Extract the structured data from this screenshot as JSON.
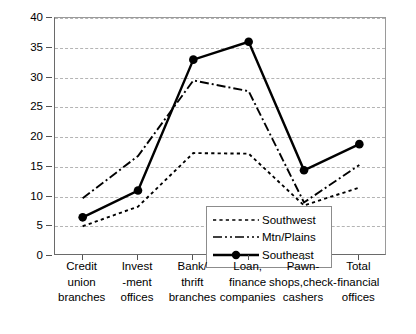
{
  "chart_data": {
    "type": "line",
    "title": "",
    "subtitle": "",
    "xlabel": "",
    "ylabel": "",
    "ylim": [
      0,
      40
    ],
    "yticks": [
      0,
      5,
      10,
      15,
      20,
      25,
      30,
      35,
      40
    ],
    "ytick_labels": [
      "0",
      "5",
      "10",
      "15",
      "20",
      "25",
      "30",
      "35",
      "40"
    ],
    "grid": true,
    "grid_axis": "y",
    "grid_style": "dashed",
    "legend_position": "center-lower-inside",
    "categories": [
      "Credit union branches",
      "Invest-ment offices",
      "Bank/ thrift branches",
      "Loan, finance companies",
      "Pawn-shops,check-cashers",
      "Total financial offices"
    ],
    "category_lines": [
      [
        "Credit",
        "union",
        "branches"
      ],
      [
        "Invest",
        "-ment",
        "offices"
      ],
      [
        "Bank/",
        "thrift",
        "branches"
      ],
      [
        "Loan,",
        "finance",
        "companies"
      ],
      [
        "Pawn-",
        "shops,check-",
        "cashers"
      ],
      [
        "Total",
        "financial",
        "offices"
      ]
    ],
    "series": [
      {
        "name": "Southwest",
        "style": "dotted",
        "marker": "none",
        "color": "#000000",
        "values": [
          5.0,
          8.3,
          17.3,
          17.2,
          8.5,
          11.5
        ]
      },
      {
        "name": "Mtn/Plains",
        "style": "dash-dot",
        "marker": "none",
        "color": "#000000",
        "values": [
          9.7,
          16.8,
          29.5,
          27.7,
          9.0,
          15.3
        ]
      },
      {
        "name": "Southeast",
        "style": "solid",
        "marker": "filled-circle",
        "color": "#000000",
        "values": [
          6.5,
          11.0,
          33.0,
          36.0,
          14.4,
          18.8
        ]
      }
    ]
  }
}
